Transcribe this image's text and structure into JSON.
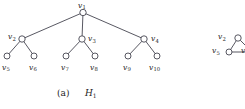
{
  "figure": {
    "caption_label": "(a)",
    "caption_name": "H",
    "caption_name_sub": "1",
    "line_color": "#3a3a46",
    "node_fill": "#ffffff",
    "node_stroke": "#3a3a46",
    "text_color": "#1c1c1c",
    "background": "#ffffff"
  },
  "graph": {
    "type": "tree",
    "name": "H1",
    "node_count": 10,
    "edge_count": 9,
    "nodes": [
      {
        "id": "v1",
        "label": "v",
        "sub": "1",
        "cx": 83,
        "cy": 12.5,
        "r": 3.2,
        "level": 0,
        "label_x": 78,
        "label_y": 1.5,
        "label_align": "left"
      },
      {
        "id": "v2",
        "label": "v",
        "sub": "2",
        "cx": 22,
        "cy": 39,
        "r": 3.2,
        "level": 1,
        "label_x": 8,
        "label_y": 33,
        "label_align": "left"
      },
      {
        "id": "v3",
        "label": "v",
        "sub": "3",
        "cx": 82,
        "cy": 39,
        "r": 3.2,
        "level": 1,
        "label_x": 88,
        "label_y": 35,
        "label_align": "left"
      },
      {
        "id": "v4",
        "label": "v",
        "sub": "4",
        "cx": 144,
        "cy": 39,
        "r": 3.2,
        "level": 1,
        "label_x": 151,
        "label_y": 35,
        "label_align": "left"
      },
      {
        "id": "v5",
        "label": "v",
        "sub": "5",
        "cx": 7,
        "cy": 56,
        "r": 3.0,
        "level": 2,
        "label_x": 2,
        "label_y": 63.5,
        "label_align": "left"
      },
      {
        "id": "v6",
        "label": "v",
        "sub": "6",
        "cx": 34,
        "cy": 56,
        "r": 3.0,
        "level": 2,
        "label_x": 29,
        "label_y": 63.5,
        "label_align": "left"
      },
      {
        "id": "v7",
        "label": "v",
        "sub": "7",
        "cx": 66,
        "cy": 56,
        "r": 3.0,
        "level": 2,
        "label_x": 61,
        "label_y": 63.5,
        "label_align": "left"
      },
      {
        "id": "v8",
        "label": "v",
        "sub": "8",
        "cx": 95,
        "cy": 56,
        "r": 3.0,
        "level": 2,
        "label_x": 90,
        "label_y": 63.5,
        "label_align": "left"
      },
      {
        "id": "v9",
        "label": "v",
        "sub": "9",
        "cx": 128,
        "cy": 56,
        "r": 3.0,
        "level": 2,
        "label_x": 123,
        "label_y": 63.5,
        "label_align": "left"
      },
      {
        "id": "v10",
        "label": "v",
        "sub": "10",
        "cx": 157,
        "cy": 56,
        "r": 3.0,
        "level": 2,
        "label_x": 149,
        "label_y": 63.5,
        "label_align": "left"
      }
    ],
    "edges": [
      {
        "from": "v1",
        "to": "v2"
      },
      {
        "from": "v1",
        "to": "v3"
      },
      {
        "from": "v1",
        "to": "v4"
      },
      {
        "from": "v2",
        "to": "v5"
      },
      {
        "from": "v2",
        "to": "v6"
      },
      {
        "from": "v3",
        "to": "v7"
      },
      {
        "from": "v3",
        "to": "v8"
      },
      {
        "from": "v4",
        "to": "v9"
      },
      {
        "from": "v4",
        "to": "v10"
      }
    ]
  },
  "partial_figure": {
    "nodes": [
      {
        "id": "p_v2",
        "label": "v",
        "sub": "2",
        "cx": 238,
        "cy": 38,
        "r": 3.2,
        "label_x": 218,
        "label_y": 33
      },
      {
        "id": "p_v5",
        "label": "v",
        "sub": "5",
        "cx": 229,
        "cy": 52,
        "r": 3.0,
        "label_x": 212,
        "label_y": 47
      },
      {
        "id": "p_v",
        "label": "v",
        "sub": "",
        "cx": 252,
        "cy": 52,
        "r": 3.0,
        "label_x": 241,
        "label_y": 47
      }
    ],
    "edges": [
      {
        "from": "p_v2",
        "to": "p_v5"
      },
      {
        "from": "p_v5",
        "to": "p_v"
      },
      {
        "from": "p_v2",
        "to": "p_v"
      }
    ]
  }
}
